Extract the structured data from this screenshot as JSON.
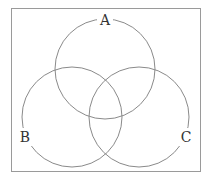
{
  "diagram": {
    "type": "venn",
    "sets": [
      {
        "label": "A",
        "cx": 105,
        "cy": 69,
        "r": 50,
        "label_x": 105,
        "label_y": 25
      },
      {
        "label": "B",
        "cx": 72,
        "cy": 117,
        "r": 50,
        "label_x": 25,
        "label_y": 142
      },
      {
        "label": "C",
        "cx": 139,
        "cy": 117,
        "r": 50,
        "label_x": 186,
        "label_y": 142
      }
    ],
    "colors": {
      "stroke": "#8a8a8a",
      "frame": "#9a9a9a",
      "text": "#333333"
    }
  }
}
